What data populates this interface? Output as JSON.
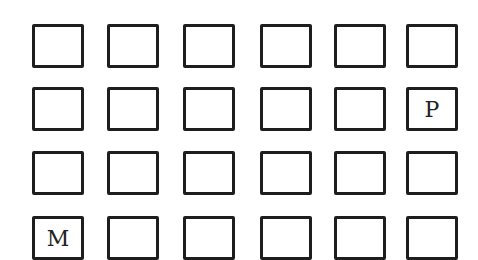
{
  "grid": {
    "rows": 4,
    "cols": 6,
    "border_color": "#1e1e1e",
    "background": "#ffffff",
    "col_x": [
      32,
      107,
      183,
      260,
      334,
      406
    ],
    "row_y": [
      24,
      87,
      151,
      216
    ],
    "cells": [
      [
        "",
        "",
        "",
        "",
        "",
        ""
      ],
      [
        "",
        "",
        "",
        "",
        "",
        "P"
      ],
      [
        "",
        "",
        "",
        "",
        "",
        ""
      ],
      [
        "M",
        "",
        "",
        "",
        "",
        ""
      ]
    ]
  }
}
